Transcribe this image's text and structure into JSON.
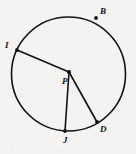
{
  "figure": {
    "kind": "geometry-diagram",
    "width": 136,
    "height": 154,
    "background_color": "#f4f3f1",
    "stroke_color": "#121212",
    "label_color": "#111111"
  },
  "circle": {
    "name": "circle-P",
    "center_x": 68.5,
    "center_y": 74,
    "radius": 57,
    "stroke_width": 1.6
  },
  "points": [
    {
      "id": "B",
      "label": "B",
      "x": 96,
      "y": 18,
      "label_x": 100,
      "label_y": 7,
      "marker": true,
      "on_circle": true
    },
    {
      "id": "I",
      "label": "I",
      "x": 17,
      "y": 50,
      "label_x": 5,
      "label_y": 41,
      "marker": true,
      "on_circle": true
    },
    {
      "id": "P",
      "label": "P",
      "x": 69,
      "y": 72,
      "label_x": 62,
      "label_y": 77,
      "marker": true,
      "on_circle": false
    },
    {
      "id": "D",
      "label": "D",
      "x": 97,
      "y": 122,
      "label_x": 100,
      "label_y": 125,
      "marker": true,
      "on_circle": true
    },
    {
      "id": "J",
      "label": "J",
      "x": 65,
      "y": 131,
      "label_x": 63,
      "label_y": 136,
      "marker": true,
      "on_circle": true
    }
  ],
  "segments": [
    {
      "id": "IP",
      "name": "radius-I-P",
      "x1": 17,
      "y1": 50,
      "x2": 69,
      "y2": 72,
      "stroke_width": 1.6
    },
    {
      "id": "PJ",
      "name": "radius-P-J",
      "x1": 69,
      "y1": 72,
      "x2": 65,
      "y2": 131,
      "stroke_width": 1.6
    },
    {
      "id": "PD",
      "name": "radius-P-D",
      "x1": 69,
      "y1": 72,
      "x2": 97,
      "y2": 122,
      "stroke_width": 1.6
    }
  ]
}
